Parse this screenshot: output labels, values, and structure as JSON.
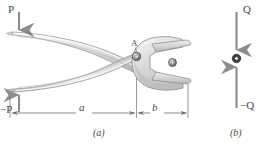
{
  "figure": {
    "panels": [
      {
        "id": "a",
        "caption": "(a)",
        "name": "pliers-diagram",
        "labels": {
          "force_top": "P",
          "force_bottom": "−P",
          "pivot": "A",
          "dim_long": "a",
          "dim_short": "b"
        }
      },
      {
        "id": "b",
        "caption": "(b)",
        "name": "pin-free-body-diagram",
        "labels": {
          "force_top": "Q",
          "force_bottom": "−Q"
        }
      }
    ]
  },
  "colors": {
    "metal_light": "#e8e8e8",
    "metal_mid": "#cfcfcf",
    "metal_dark": "#a9a9a9",
    "outline": "#8d8d8d",
    "arrow": "#8c8c8c",
    "dimension_line": "#6e6e6e",
    "text": "#4a4a4a",
    "background": "#ffffff"
  }
}
